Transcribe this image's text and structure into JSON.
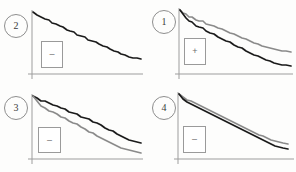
{
  "figure": {
    "width": 296,
    "height": 172,
    "background_color": "#fdfdfc",
    "layout": "2x2-grid",
    "panel_width": 148,
    "panel_height": 86
  },
  "colors": {
    "series_primary": "#1a1a1a",
    "series_secondary": "#8a8a8a",
    "axis": "#9d9d9d",
    "badge_border": "#8e8e8e",
    "legend_border": "#9a9a9a",
    "text": "#3a3a3a"
  },
  "panels": [
    {
      "id": "panel-top-left",
      "badge_label": "2",
      "legend_symbol": "–",
      "legend_symbol_name": "minus-sign",
      "position": {
        "left": 0,
        "top": 0
      },
      "badge_position": {
        "left": 4,
        "top": 14
      },
      "legend_position": {
        "left": 41,
        "top": 41,
        "width": 22,
        "height": 27
      },
      "axis": {
        "x_start": 32,
        "x_end": 143,
        "y_top": 10,
        "y_bottom": 74,
        "y_overshoot": 5
      },
      "series": [
        {
          "name": "black-curve",
          "color": "#1a1a1a",
          "width": 1.6,
          "points": "33,12 37,15 41,17 45,19 49,20 52,23 56,24 60,26 63,27 67,30 70,31 74,32 77,35 81,36 85,37 88,40 92,41 96,42 99,44 103,46 107,47 110,49 114,51 118,52 121,54 125,55 129,57 133,58 137,58 141,59"
        }
      ]
    },
    {
      "id": "panel-top-right",
      "badge_label": "1",
      "legend_symbol": "+",
      "legend_symbol_name": "plus-sign",
      "position": {
        "left": 148,
        "top": 0
      },
      "badge_position": {
        "left": 4,
        "top": 10
      },
      "legend_position": {
        "left": 36,
        "top": 38,
        "width": 22,
        "height": 27
      },
      "axis": {
        "x_start": 31,
        "x_end": 145,
        "y_top": 8,
        "y_bottom": 74,
        "y_overshoot": 5
      },
      "series": [
        {
          "name": "gray-curve",
          "color": "#8a8a8a",
          "width": 1.6,
          "points": "32,10 35,13 38,14 41,17 44,17 48,20 51,21 55,21 58,24 62,25 66,26 70,28 74,29 78,31 82,33 86,34 90,36 94,38 98,39 102,41 106,43 110,44 114,46 118,47 122,48 126,49 130,50 134,51 138,51 143,52"
        },
        {
          "name": "black-curve",
          "color": "#1a1a1a",
          "width": 1.7,
          "points": "32,10 35,14 38,18 41,21 44,22 48,26 51,27 55,28 58,31 62,33 66,34 70,37 74,39 78,41 82,42 86,45 90,47 94,48 98,51 102,53 106,55 110,56 114,58 118,60 122,61 126,63 130,64 134,65 138,65 143,66"
        }
      ]
    },
    {
      "id": "panel-bottom-left",
      "badge_label": "3",
      "legend_symbol": "–",
      "legend_symbol_name": "minus-sign",
      "position": {
        "left": 0,
        "top": 86
      },
      "badge_position": {
        "left": 4,
        "top": 10
      },
      "legend_position": {
        "left": 38,
        "top": 41,
        "width": 23,
        "height": 26
      },
      "axis": {
        "x_start": 32,
        "x_end": 143,
        "y_top": 8,
        "y_bottom": 73,
        "y_overshoot": 5
      },
      "series": [
        {
          "name": "black-curve",
          "color": "#1a1a1a",
          "width": 1.7,
          "points": "33,10 37,12 41,15 45,15 49,17 53,19 57,20 61,22 65,23 69,26 73,27 77,28 81,31 85,32 89,33 93,36 97,37 101,39 105,42 109,44 113,45 117,48 121,50 125,52 129,54 133,55 137,56 141,57"
        },
        {
          "name": "gray-curve",
          "color": "#8a8a8a",
          "width": 1.6,
          "points": "33,10 37,15 41,20 45,22 49,25 53,26 57,28 61,31 65,32 69,35 73,37 77,38 81,41 85,43 89,46 93,47 97,50 101,52 105,54 109,56 113,58 117,60 121,62 125,63 129,64 133,65 137,66 141,67"
        }
      ]
    },
    {
      "id": "panel-bottom-right",
      "badge_label": "4",
      "legend_symbol": "–",
      "legend_symbol_name": "minus-sign",
      "position": {
        "left": 148,
        "top": 86
      },
      "badge_position": {
        "left": 4,
        "top": 10
      },
      "legend_position": {
        "left": 35,
        "top": 40,
        "width": 23,
        "height": 27
      },
      "axis": {
        "x_start": 30,
        "x_end": 146,
        "y_top": 6,
        "y_bottom": 73,
        "y_overshoot": 5
      },
      "series": [
        {
          "name": "gray-curve",
          "color": "#8a8a8a",
          "width": 1.6,
          "points": "31,8 35,11 39,14 43,15 47,17 51,19 55,21 59,23 63,25 67,27 71,29 75,31 79,33 83,35 87,37 91,39 95,41 99,43 103,45 107,47 111,49 115,50 119,52 123,54 127,55 131,56 135,57 140,58"
        },
        {
          "name": "black-curve",
          "color": "#1a1a1a",
          "width": 1.7,
          "points": "31,8 35,13 39,16 43,18 47,20 51,22 55,24 59,26 63,28 67,30 71,32 75,34 79,36 83,38 87,40 91,42 95,44 99,46 103,48 107,50 111,52 115,54 119,56 123,58 127,60 131,61 135,62 140,63"
        }
      ]
    }
  ],
  "chart_data": {
    "type": "line",
    "title": "",
    "xlabel": "",
    "ylabel": "",
    "grid": false,
    "legend_position": "inside-left",
    "panel_count": 4,
    "panels": [
      {
        "label": "2",
        "legend_symbol": "–",
        "series": [
          {
            "name": "black-curve",
            "color": "#1a1a1a",
            "x": [
              0,
              3.4,
              6.9,
              10.3,
              13.8,
              17.2,
              20.7,
              24.1,
              27.6,
              31.0,
              34.5,
              37.9,
              41.4,
              44.8,
              48.3,
              51.7,
              55.2,
              58.6,
              62.1,
              65.5,
              69.0,
              72.4,
              75.9,
              79.3,
              82.8,
              86.2,
              89.7,
              93.1,
              96.6,
              100
            ],
            "y": [
              96.9,
              92.2,
              89.1,
              85.9,
              84.4,
              79.7,
              78.1,
              75.0,
              73.4,
              68.8,
              67.2,
              65.6,
              61.0,
              59.4,
              57.8,
              53.1,
              51.6,
              50.0,
              46.9,
              43.8,
              42.2,
              39.1,
              35.9,
              34.4,
              31.3,
              29.7,
              26.6,
              25.0,
              25.0,
              23.4
            ]
          }
        ]
      },
      {
        "label": "1",
        "legend_symbol": "+",
        "series": [
          {
            "name": "gray-curve",
            "color": "#8a8a8a",
            "x": [
              0,
              2.7,
              5.4,
              8.1,
              10.8,
              14.4,
              17.1,
              20.7,
              23.4,
              27.0,
              30.6,
              34.2,
              37.8,
              41.4,
              45.0,
              48.6,
              52.3,
              55.9,
              59.5,
              63.1,
              66.7,
              70.3,
              73.9,
              77.5,
              81.1,
              84.7,
              88.3,
              91.9,
              95.5,
              100
            ],
            "y": [
              97.0,
              92.4,
              90.9,
              86.4,
              86.4,
              81.8,
              80.3,
              80.3,
              75.8,
              74.2,
              72.7,
              69.7,
              68.2,
              65.2,
              62.1,
              60.6,
              57.6,
              54.5,
              53.0,
              50.0,
              47.0,
              45.5,
              42.4,
              40.9,
              39.4,
              37.9,
              36.4,
              34.8,
              34.8,
              33.3
            ]
          },
          {
            "name": "black-curve",
            "color": "#1a1a1a",
            "x": [
              0,
              2.7,
              5.4,
              8.1,
              10.8,
              14.4,
              17.1,
              20.7,
              23.4,
              27.0,
              30.6,
              34.2,
              37.8,
              41.4,
              45.0,
              48.6,
              52.3,
              55.9,
              59.5,
              63.1,
              66.7,
              70.3,
              73.9,
              77.5,
              81.1,
              84.7,
              88.3,
              91.9,
              95.5,
              100
            ],
            "y": [
              97.0,
              90.9,
              84.8,
              80.3,
              78.8,
              72.7,
              71.2,
              69.7,
              65.2,
              62.1,
              60.6,
              56.1,
              53.0,
              50.0,
              48.5,
              43.9,
              40.9,
              39.4,
              34.8,
              31.8,
              28.8,
              27.3,
              24.2,
              21.2,
              19.7,
              16.7,
              15.2,
              13.6,
              13.6,
              12.1
            ]
          }
        ]
      },
      {
        "label": "3",
        "legend_symbol": "–",
        "series": [
          {
            "name": "black-curve",
            "color": "#1a1a1a",
            "x": [
              0,
              3.7,
              7.4,
              11.1,
              14.8,
              18.5,
              22.2,
              25.9,
              29.6,
              33.3,
              37.0,
              40.7,
              44.4,
              48.1,
              51.9,
              55.6,
              59.3,
              63.0,
              66.7,
              70.4,
              74.1,
              77.8,
              81.5,
              85.2,
              88.9,
              92.6,
              96.3,
              100
            ],
            "y": [
              96.9,
              93.8,
              89.2,
              89.2,
              86.2,
              83.1,
              81.5,
              78.5,
              76.9,
              72.3,
              70.8,
              69.2,
              64.6,
              63.1,
              61.5,
              56.9,
              55.4,
              52.3,
              47.7,
              44.6,
              43.1,
              38.5,
              35.4,
              32.3,
              29.2,
              27.7,
              26.2,
              24.6
            ]
          },
          {
            "name": "gray-curve",
            "color": "#8a8a8a",
            "x": [
              0,
              3.7,
              7.4,
              11.1,
              14.8,
              18.5,
              22.2,
              25.9,
              29.6,
              33.3,
              37.0,
              40.7,
              44.4,
              48.1,
              51.9,
              55.6,
              59.3,
              63.0,
              66.7,
              70.4,
              74.1,
              77.8,
              81.5,
              85.2,
              88.9,
              92.6,
              96.3,
              100
            ],
            "y": [
              96.9,
              89.2,
              81.5,
              78.5,
              73.8,
              72.3,
              69.2,
              64.6,
              63.1,
              58.5,
              55.4,
              53.8,
              49.2,
              46.2,
              41.5,
              40.0,
              35.4,
              32.3,
              29.2,
              26.2,
              23.1,
              20.0,
              16.9,
              15.4,
              13.8,
              12.3,
              10.8,
              9.2
            ]
          }
        ]
      },
      {
        "label": "4",
        "legend_symbol": "–",
        "series": [
          {
            "name": "gray-curve",
            "color": "#8a8a8a",
            "x": [
              0,
              3.7,
              7.3,
              11.0,
              14.7,
              18.3,
              22.0,
              25.7,
              29.4,
              33.0,
              36.7,
              40.4,
              44.0,
              47.7,
              51.4,
              55.0,
              58.7,
              62.4,
              66.1,
              69.7,
              73.4,
              77.1,
              80.7,
              84.4,
              88.1,
              91.7,
              95.4,
              100
            ],
            "y": [
              97.0,
              92.5,
              88.1,
              86.6,
              83.6,
              80.6,
              77.6,
              74.6,
              71.6,
              68.7,
              65.7,
              62.7,
              59.7,
              56.7,
              53.7,
              50.7,
              47.8,
              44.8,
              41.8,
              38.8,
              35.8,
              34.3,
              31.3,
              28.4,
              26.9,
              25.4,
              23.9,
              22.4
            ]
          },
          {
            "name": "black-curve",
            "color": "#1a1a1a",
            "x": [
              0,
              3.7,
              7.3,
              11.0,
              14.7,
              18.3,
              22.0,
              25.7,
              29.4,
              33.0,
              36.7,
              40.4,
              44.0,
              47.7,
              51.4,
              55.0,
              58.7,
              62.4,
              66.1,
              69.7,
              73.4,
              77.1,
              80.7,
              84.4,
              88.1,
              91.7,
              95.4,
              100
            ],
            "y": [
              97.0,
              89.6,
              85.1,
              82.1,
              79.1,
              76.1,
              73.1,
              70.1,
              67.2,
              64.2,
              61.2,
              58.2,
              55.2,
              52.2,
              49.3,
              46.3,
              43.3,
              40.3,
              37.3,
              34.3,
              31.3,
              28.4,
              25.4,
              22.4,
              19.4,
              17.9,
              16.4,
              14.9
            ]
          }
        ]
      }
    ]
  }
}
